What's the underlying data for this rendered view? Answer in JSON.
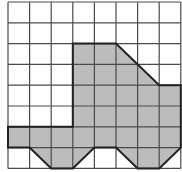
{
  "diagram": {
    "type": "grid-shape",
    "grid": {
      "columns": 8,
      "rows": 8,
      "origin_x": 8,
      "origin_y": 2,
      "cell_width": 21.6,
      "cell_height": 20.8,
      "line_color": "#4a4a4a"
    },
    "shape": {
      "description": "Truck-like polygon on a grid",
      "fill_color": "#bcbcbc",
      "outline_color": "#222222",
      "vertices": [
        [
          3,
          2
        ],
        [
          5,
          2
        ],
        [
          7,
          4
        ],
        [
          8,
          4
        ],
        [
          8,
          7
        ],
        [
          7,
          8
        ],
        [
          6,
          8
        ],
        [
          5,
          7
        ],
        [
          4,
          7
        ],
        [
          3,
          8
        ],
        [
          2,
          8
        ],
        [
          1,
          7
        ],
        [
          0,
          7
        ],
        [
          0,
          6
        ],
        [
          3,
          6
        ]
      ]
    }
  }
}
